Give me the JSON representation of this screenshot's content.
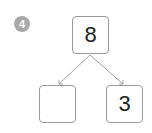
{
  "problem": {
    "number": "4"
  },
  "number_bond": {
    "whole": "8",
    "part_left": "",
    "part_right": "3",
    "line_color": "#a0a0a0",
    "box_border_color": "#9a9a9a",
    "badge_color": "#a8a8a8"
  }
}
